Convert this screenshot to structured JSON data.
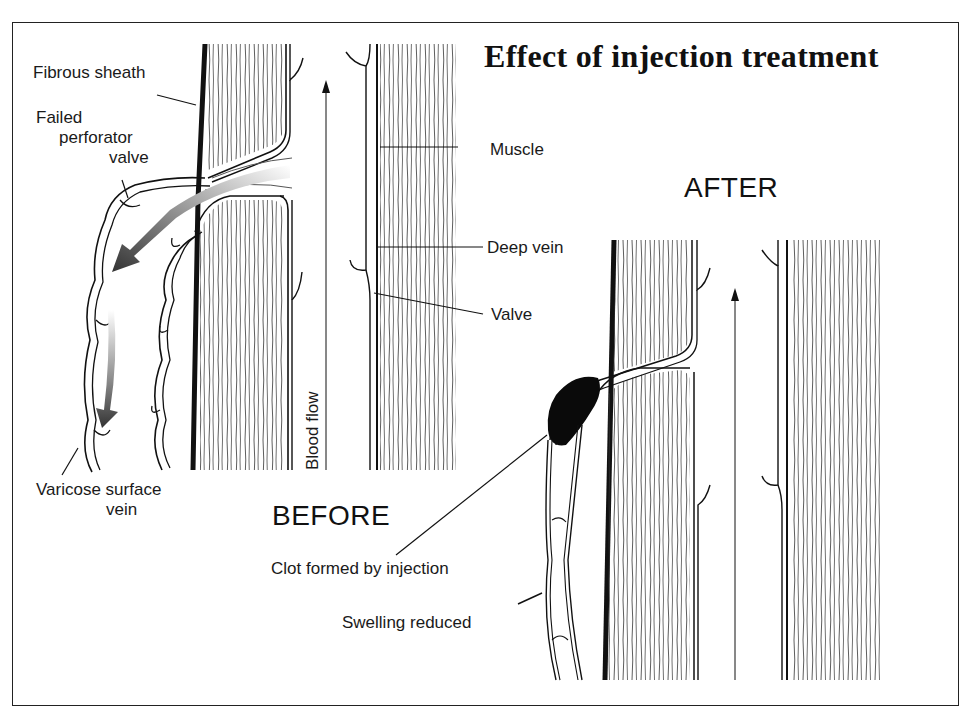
{
  "title": "Effect of injection treatment",
  "panels": {
    "before": {
      "heading": "BEFORE",
      "labels": {
        "fibrous_sheath": "Fibrous sheath",
        "failed_perforator_valve_line1": "Failed",
        "failed_perforator_valve_line2": "perforator",
        "failed_perforator_valve_line3": "valve",
        "muscle": "Muscle",
        "deep_vein": "Deep vein",
        "valve": "Valve",
        "blood_flow": "Blood flow",
        "varicose_line1": "Varicose surface",
        "varicose_line2": "vein"
      }
    },
    "after": {
      "heading": "AFTER",
      "labels": {
        "clot": "Clot formed by injection",
        "swelling": "Swelling reduced"
      }
    }
  },
  "colors": {
    "ink": "#111111",
    "background": "#ffffff",
    "arrow_dark": "#444444",
    "arrow_light": "#dddddd"
  }
}
